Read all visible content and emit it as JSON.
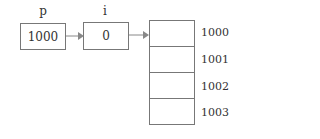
{
  "pointer_p": {
    "label": "p",
    "value": "1000"
  },
  "var_i": {
    "label": "i",
    "value": "0"
  },
  "memory": {
    "addresses": [
      "1000",
      "1001",
      "1002",
      "1003"
    ]
  }
}
